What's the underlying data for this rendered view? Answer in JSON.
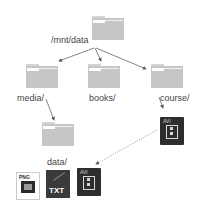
{
  "diagram": {
    "type": "directory-tree",
    "nodes": [
      {
        "id": "root",
        "label": "/mnt/data",
        "kind": "folder"
      },
      {
        "id": "media",
        "label": "media/",
        "kind": "folder"
      },
      {
        "id": "books",
        "label": "books/",
        "kind": "folder"
      },
      {
        "id": "course",
        "label": "course/",
        "kind": "folder"
      },
      {
        "id": "data",
        "label": "data/",
        "kind": "folder"
      },
      {
        "id": "course_avi",
        "label": "AVI",
        "kind": "file"
      },
      {
        "id": "png_file",
        "label": "PNG",
        "kind": "file"
      },
      {
        "id": "txt_file",
        "label": "TXT",
        "kind": "file"
      },
      {
        "id": "data_avi",
        "label": "AVI",
        "kind": "file"
      }
    ],
    "edges": [
      {
        "from": "root",
        "to": "media",
        "style": "solid"
      },
      {
        "from": "root",
        "to": "books",
        "style": "solid"
      },
      {
        "from": "root",
        "to": "course",
        "style": "solid"
      },
      {
        "from": "media",
        "to": "data",
        "style": "solid"
      },
      {
        "from": "course",
        "to": "course_avi",
        "style": "solid"
      },
      {
        "from": "course_avi",
        "to": "data_avi",
        "style": "dotted"
      }
    ],
    "labels": {
      "root": "/mnt/data",
      "media": "media/",
      "books": "books/",
      "course": "course/",
      "data": "data/"
    },
    "file_types": {
      "png": "PNG",
      "txt": "TXT",
      "avi": "AVI"
    }
  }
}
